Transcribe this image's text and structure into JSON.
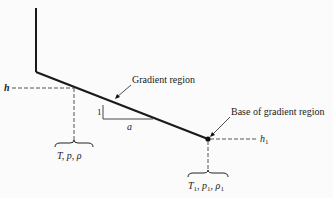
{
  "diagram": {
    "labels": {
      "gradient_region": "Gradient region",
      "base_of_gradient_region": "Base of gradient region",
      "h": "h",
      "h1": "h",
      "h1_sub": "1",
      "slope_rise": "1",
      "slope_run": "a",
      "state_left": "T, p, ρ",
      "state_right_T": "T",
      "state_right_p": "p",
      "state_right_rho": "ρ",
      "sub1": "1"
    },
    "colors": {
      "line": "#1a1a1a",
      "dash": "#555555",
      "background": "#fbfbfb"
    }
  }
}
